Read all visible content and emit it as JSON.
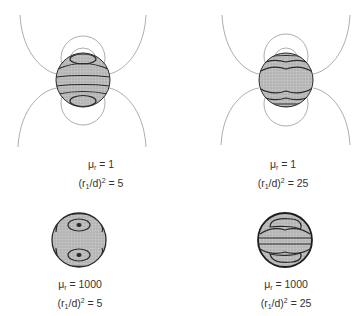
{
  "figure": {
    "panels": [
      {
        "id": "a",
        "mu_r_symbol": "μ",
        "mu_r_sub": "r",
        "mu_r_value": "1",
        "ratio_prefix": "(r",
        "ratio_sub": "1",
        "ratio_mid": "/d)",
        "ratio_sup": "2",
        "ratio_value": "5",
        "field_lines_outside": true,
        "contour_style": "horizontal-bands"
      },
      {
        "id": "b",
        "mu_r_symbol": "μ",
        "mu_r_sub": "r",
        "mu_r_value": "1",
        "ratio_prefix": "(r",
        "ratio_sub": "1",
        "ratio_mid": "/d)",
        "ratio_sup": "2",
        "ratio_value": "25",
        "field_lines_outside": true,
        "contour_style": "wavy-bands"
      },
      {
        "id": "c",
        "mu_r_symbol": "μ",
        "mu_r_sub": "r",
        "mu_r_value": "1000",
        "ratio_prefix": "(r",
        "ratio_sub": "1",
        "ratio_mid": "/d)",
        "ratio_sup": "2",
        "ratio_value": "5",
        "field_lines_outside": false,
        "contour_style": "two-loops"
      },
      {
        "id": "d",
        "mu_r_symbol": "μ",
        "mu_r_sub": "r",
        "mu_r_value": "1000",
        "ratio_prefix": "(r",
        "ratio_sub": "1",
        "ratio_mid": "/d)",
        "ratio_sup": "2",
        "ratio_value": "25",
        "field_lines_outside": false,
        "contour_style": "stacked-bands"
      }
    ],
    "colors": {
      "sphere_fill": "#b8b8b8",
      "contour": "#2a2a2a",
      "field_line": "#8a8a8a",
      "text": "#333333"
    }
  }
}
